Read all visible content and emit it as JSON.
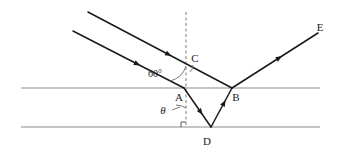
{
  "figure": {
    "type": "optics-ray-diagram",
    "background_color": "#ffffff",
    "ray_color": "#1a1a1a",
    "boundary_color": "#8c8c8c",
    "normal_color": "#7a7a7a",
    "label_color": "#1a1a1a"
  },
  "labels": {
    "point_a": "A",
    "point_b": "B",
    "point_c": "C",
    "point_d": "D",
    "point_e": "E",
    "angle_incidence": "60°",
    "angle_refraction": "θ"
  },
  "geometry": {
    "boundaries": [
      {
        "name": "upper-boundary",
        "x1": 21,
        "y1": 88,
        "x2": 320,
        "y2": 88
      },
      {
        "name": "lower-boundary",
        "x1": 21,
        "y1": 127,
        "x2": 320,
        "y2": 127
      }
    ],
    "normal_line": {
      "name": "normal-at-a",
      "x1": 186,
      "y1": 12,
      "x2": 186,
      "y2": 127
    },
    "rays": [
      {
        "name": "incident-ray-upper",
        "x1": 88,
        "y1": 12,
        "x2": 232,
        "y2": 88,
        "arrow_t": 0.56
      },
      {
        "name": "incident-ray-lower",
        "x1": 73,
        "y1": 31,
        "x2": 184,
        "y2": 88,
        "arrow_t": 0.58
      },
      {
        "name": "refracted-ray-ad",
        "x1": 184,
        "y1": 88,
        "x2": 211,
        "y2": 127,
        "arrow_t": 0.62
      },
      {
        "name": "reflected-ray-db",
        "x1": 211,
        "y1": 127,
        "x2": 232,
        "y2": 88,
        "arrow_t": 0.62
      },
      {
        "name": "emergent-ray-be",
        "x1": 232,
        "y1": 88,
        "x2": 318,
        "y2": 33,
        "arrow_t": 0.55
      }
    ],
    "label_positions": {
      "point_a": {
        "x": 179,
        "y": 101
      },
      "point_b": {
        "x": 236,
        "y": 101
      },
      "point_c": {
        "x": 195,
        "y": 62
      },
      "point_d": {
        "x": 207,
        "y": 145
      },
      "point_e": {
        "x": 320,
        "y": 31
      },
      "angle_incidence": {
        "x": 155,
        "y": 77
      },
      "angle_refraction": {
        "x": 163,
        "y": 114
      }
    },
    "right_angle_marker": {
      "name": "right-angle-at-normal-foot",
      "x": 186,
      "y": 127,
      "size": 5
    }
  },
  "chart_data": {
    "type": "diagram",
    "title": "",
    "annotations": [
      "A",
      "B",
      "C",
      "D",
      "E",
      "60°",
      "θ"
    ],
    "values": {
      "angle_of_incidence_deg": 60,
      "angle_of_refraction_label": "θ"
    }
  }
}
